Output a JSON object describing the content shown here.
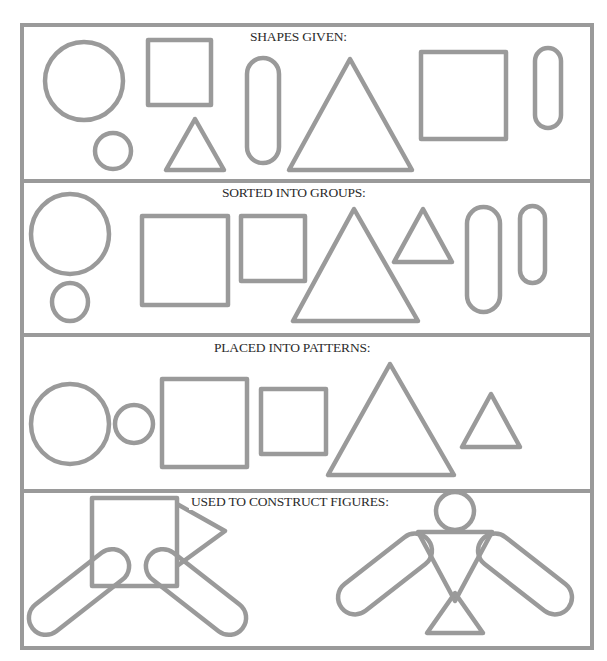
{
  "diagram": {
    "stroke_color": "#9a9a9a",
    "text_color": "#2b2b2b",
    "panels": [
      {
        "id": "given",
        "title": "SHAPES GIVEN:",
        "shapes": [
          {
            "type": "circle",
            "size": "large"
          },
          {
            "type": "square",
            "size": "small"
          },
          {
            "type": "circle",
            "size": "small"
          },
          {
            "type": "triangle",
            "size": "small"
          },
          {
            "type": "oval",
            "size": "large"
          },
          {
            "type": "triangle",
            "size": "large"
          },
          {
            "type": "square",
            "size": "large"
          },
          {
            "type": "oval",
            "size": "small"
          }
        ]
      },
      {
        "id": "sorted",
        "title": "SORTED INTO GROUPS:",
        "groups": [
          "circles",
          "squares",
          "triangles",
          "ovals"
        ]
      },
      {
        "id": "patterns",
        "title": "PLACED INTO PATTERNS:",
        "sequence": [
          "large circle",
          "small circle",
          "large square",
          "small square",
          "large triangle",
          "small triangle"
        ]
      },
      {
        "id": "figures",
        "title": "USED TO CONSTRUCT FIGURES:",
        "figures": [
          "square-body creature with triangle head and oval legs",
          "person with circle head, triangle body, oval arms"
        ]
      }
    ]
  }
}
